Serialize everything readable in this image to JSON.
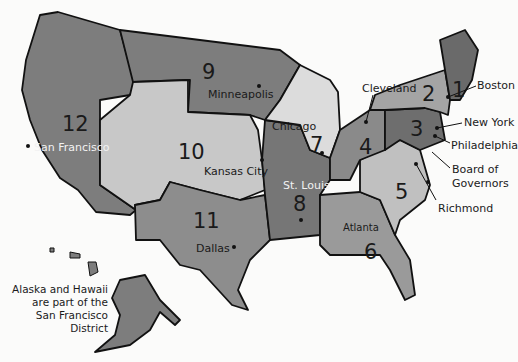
{
  "colors": {
    "dark": "#7a7a7a",
    "medium": "#9a9a9a",
    "light": "#c8c8c8",
    "lighter": "#dcdcdc",
    "border": "#111111",
    "background": "#fbfbfa"
  },
  "districts": [
    {
      "number": "1",
      "city": "Boston"
    },
    {
      "number": "2",
      "city": "New York"
    },
    {
      "number": "3",
      "city": "Philadelphia"
    },
    {
      "number": "4",
      "city": "Cleveland"
    },
    {
      "number": "5",
      "city": "Richmond"
    },
    {
      "number": "6",
      "city": "Atlanta"
    },
    {
      "number": "7",
      "city": "Chicago"
    },
    {
      "number": "8",
      "city": "St. Louis"
    },
    {
      "number": "9",
      "city": "Minneapolis"
    },
    {
      "number": "10",
      "city": "Kansas City"
    },
    {
      "number": "11",
      "city": "Dallas"
    },
    {
      "number": "12",
      "city": "San Francisco"
    }
  ],
  "board": {
    "line1": "Board of",
    "line2": "Governors"
  },
  "note": {
    "line1": "Alaska and Hawaii",
    "line2": "are part of the",
    "line3": "San Francisco District"
  }
}
